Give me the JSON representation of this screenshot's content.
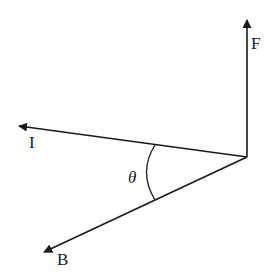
{
  "diagram": {
    "type": "vector-diagram",
    "colors": {
      "stroke": "#1a1a1a",
      "background": "#ffffff"
    },
    "origin": {
      "x": 247,
      "y": 157
    },
    "vectors": [
      {
        "id": "F",
        "label": "F",
        "tip": {
          "x": 247,
          "y": 18
        }
      },
      {
        "id": "I",
        "label": "I",
        "tip": {
          "x": 17,
          "y": 126
        }
      },
      {
        "id": "B",
        "label": "B",
        "tip": {
          "x": 42,
          "y": 253
        }
      }
    ],
    "angle": {
      "label": "θ",
      "between": [
        "I",
        "B"
      ]
    }
  }
}
